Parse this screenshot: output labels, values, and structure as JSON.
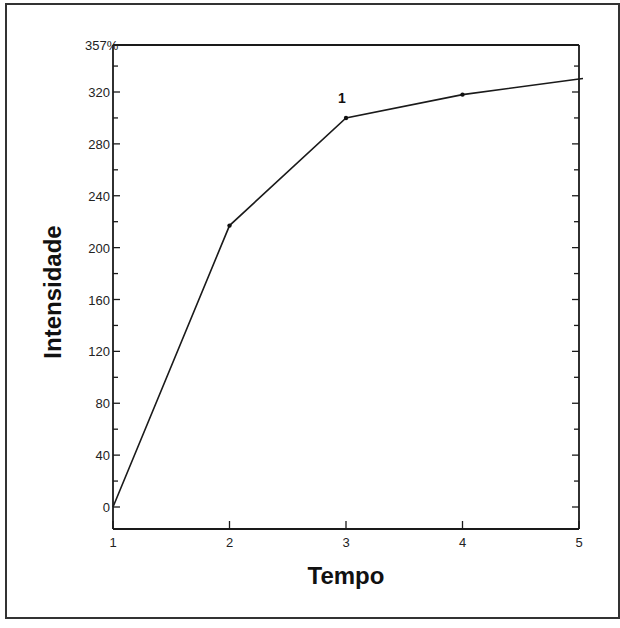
{
  "chart_data": {
    "type": "line",
    "title": "",
    "xlabel": "Tempo",
    "ylabel": "Intensidade",
    "x": [
      1,
      2,
      3,
      4,
      5
    ],
    "series": [
      {
        "name": "Intensidade",
        "values": [
          0,
          217,
          300,
          318,
          330
        ]
      }
    ],
    "xlim": [
      1,
      5
    ],
    "ylim": [
      -16,
      357
    ],
    "x_ticks": [
      "1",
      "2",
      "3",
      "4",
      "5"
    ],
    "y_ticks": [
      "0",
      "40",
      "80",
      "120",
      "160",
      "200",
      "240",
      "280",
      "320"
    ],
    "y_top_label": "357%",
    "annotations": [
      {
        "text": "1",
        "x": 3,
        "y": 300
      }
    ],
    "grid": false,
    "legend": "none",
    "colors": {
      "line": "#1a1a1a",
      "axis": "#1a1a1a",
      "frame": "#333333"
    }
  }
}
